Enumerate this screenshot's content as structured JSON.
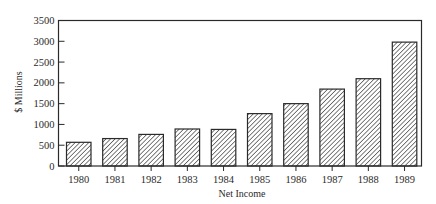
{
  "chart_data": {
    "type": "bar",
    "title": "",
    "xlabel": "Net Income",
    "ylabel": "$ Millions",
    "categories": [
      "1980",
      "1981",
      "1982",
      "1983",
      "1984",
      "1985",
      "1986",
      "1987",
      "1988",
      "1989"
    ],
    "values": [
      570,
      660,
      760,
      890,
      880,
      1260,
      1500,
      1850,
      2100,
      2980
    ],
    "ylim": [
      0,
      3500
    ],
    "yticks": [
      0,
      500,
      1000,
      1500,
      2000,
      2500,
      3000,
      3500
    ],
    "grid": false,
    "legend": null,
    "bar_fill": "diagonal-hatch",
    "colors": {
      "ink": "#2a2a2a",
      "background": "#ffffff"
    }
  }
}
